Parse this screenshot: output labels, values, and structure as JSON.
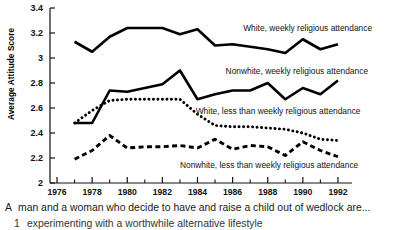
{
  "figure": {
    "ylabel": "Average Attitude Score",
    "caption_line_1_marker": "A",
    "caption_line_1": "man and a woman who decide to have and raise a child out of wedlock are...",
    "caption_line_2_marker": "1",
    "caption_line_2": "experimenting with a worthwhile alternative lifestyle"
  },
  "chart_data": {
    "type": "line",
    "title": "",
    "xlabel": "",
    "ylabel": "Average Attitude Score",
    "xlim": [
      1975.6,
      1992.8
    ],
    "ylim": [
      2.0,
      3.4
    ],
    "yticks": [
      2,
      2.2,
      2.4,
      2.6,
      2.8,
      3,
      3.2,
      3.4
    ],
    "ytick_labels": [
      "2",
      "2.2",
      "2.4",
      "2.6",
      "2.8",
      "3",
      "3.2",
      "3.4"
    ],
    "xticks": [
      1976,
      1978,
      1980,
      1982,
      1984,
      1986,
      1988,
      1990,
      1992
    ],
    "xtick_labels": [
      "1976",
      "1978",
      "1980",
      "1982",
      "1984",
      "1986",
      "1988",
      "1990",
      "1992"
    ],
    "x_minor_ticks": [
      1977,
      1979,
      1981,
      1983,
      1985,
      1987,
      1989,
      1991
    ],
    "grid": false,
    "legend_position": "inline-annotations",
    "x": [
      1977,
      1978,
      1979,
      1980,
      1981,
      1982,
      1983,
      1984,
      1985,
      1986,
      1987,
      1988,
      1989,
      1990,
      1991,
      1992
    ],
    "series": [
      {
        "name": "White, weekly religious attendance",
        "style": "solid",
        "color": "#000000",
        "values": [
          3.13,
          3.05,
          3.17,
          3.24,
          3.24,
          3.24,
          3.19,
          3.23,
          3.1,
          3.11,
          3.09,
          3.07,
          3.04,
          3.15,
          3.07,
          3.11
        ]
      },
      {
        "name": "Nonwhite, weekly religious attendance",
        "style": "solid",
        "color": "#000000",
        "values": [
          2.48,
          2.48,
          2.74,
          2.73,
          2.76,
          2.79,
          2.9,
          2.67,
          2.71,
          2.74,
          2.74,
          2.8,
          2.67,
          2.76,
          2.71,
          2.82
        ]
      },
      {
        "name": "White, less than weekly religious attendance",
        "style": "dotted",
        "color": "#000000",
        "values": [
          2.48,
          2.58,
          2.66,
          2.67,
          2.67,
          2.67,
          2.67,
          2.55,
          2.46,
          2.45,
          2.45,
          2.44,
          2.43,
          2.4,
          2.35,
          2.34
        ]
      },
      {
        "name": "Nonwhite, less than weekly religious attendance",
        "style": "dashed",
        "color": "#000000",
        "values": [
          2.19,
          2.26,
          2.38,
          2.28,
          2.29,
          2.29,
          2.3,
          2.28,
          2.35,
          2.27,
          2.3,
          2.29,
          2.22,
          2.33,
          2.26,
          2.21
        ]
      }
    ],
    "annotations": [
      {
        "text": "White, weekly religious attendance",
        "x": 1986.6,
        "y": 3.22
      },
      {
        "text": "Nonwhite, weekly religious attendance",
        "x": 1985.6,
        "y": 2.87
      },
      {
        "text": "White, less than weekly religious attendance",
        "x": 1983.9,
        "y": 2.55
      },
      {
        "text": "Nonwhite, less than weekly religious attendance",
        "x": 1983.0,
        "y": 2.12
      }
    ]
  }
}
